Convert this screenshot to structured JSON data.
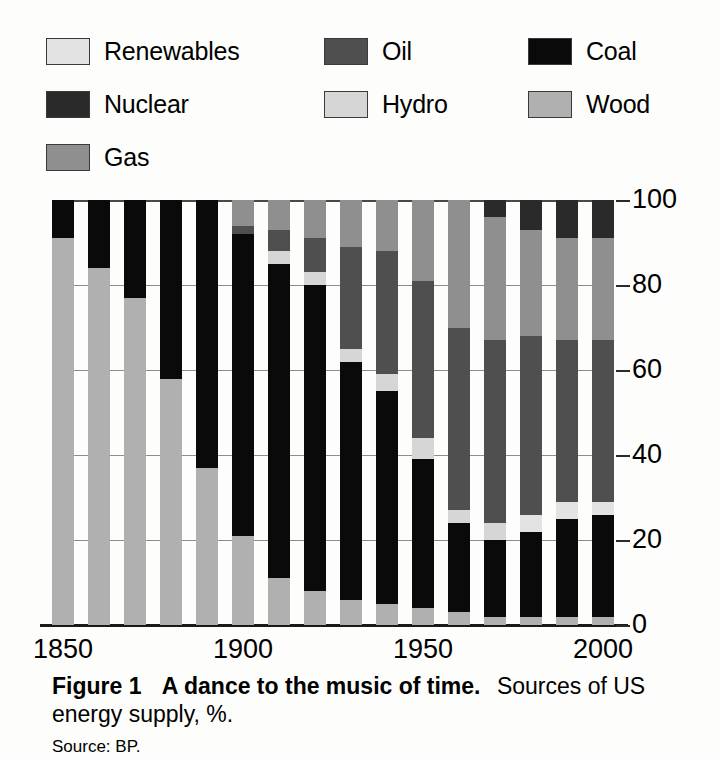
{
  "legend": {
    "items": [
      {
        "label": "Renewables",
        "key": "renewables",
        "color": "#e3e3e3",
        "col": 0,
        "row": 0
      },
      {
        "label": "Nuclear",
        "key": "nuclear",
        "color": "#2a2a2a",
        "col": 0,
        "row": 1
      },
      {
        "label": "Gas",
        "key": "gas",
        "color": "#8f8f8f",
        "col": 0,
        "row": 2
      },
      {
        "label": "Oil",
        "key": "oil",
        "color": "#4f4f4f",
        "col": 1,
        "row": 0
      },
      {
        "label": "Hydro",
        "key": "hydro",
        "color": "#d6d6d6",
        "col": 1,
        "row": 1
      },
      {
        "label": "Coal",
        "key": "coal",
        "color": "#0a0a0a",
        "col": 2,
        "row": 0
      },
      {
        "label": "Wood",
        "key": "wood",
        "color": "#b0b0b0",
        "col": 2,
        "row": 1
      }
    ]
  },
  "caption": {
    "figure_label": "Figure 1",
    "figure_title": "A dance to the music of time.",
    "description_part1": "Sources of US",
    "description_part2": "energy supply, %.",
    "source": "Source: BP."
  },
  "chart_data": {
    "type": "bar",
    "subtype": "stacked-100-percent",
    "title": "A dance to the music of time. Sources of US energy supply, %.",
    "xlabel": "",
    "ylabel": "",
    "ylim": [
      0,
      100
    ],
    "yticks": [
      0,
      20,
      40,
      60,
      80,
      100
    ],
    "ytick_labels": [
      "0",
      "20",
      "40",
      "60",
      "80",
      "100"
    ],
    "grid": true,
    "legend_position": "above-plot",
    "categories": [
      1850,
      1860,
      1870,
      1880,
      1890,
      1900,
      1910,
      1920,
      1930,
      1940,
      1950,
      1960,
      1970,
      1980,
      1990,
      2000
    ],
    "xtick_labels": [
      "1850",
      "1900",
      "1950",
      "2000"
    ],
    "xticks": [
      1850,
      1900,
      1950,
      2000
    ],
    "stack_order_bottom_to_top": [
      "hydro",
      "coal",
      "renewables",
      "oil",
      "gas",
      "nuclear",
      "wood"
    ],
    "series": [
      {
        "name": "Wood",
        "key": "wood",
        "color": "#b0b0b0",
        "values": [
          91,
          84,
          77,
          58,
          37,
          21,
          11,
          8,
          6,
          5,
          4,
          3,
          2,
          2,
          2,
          2
        ]
      },
      {
        "name": "Coal",
        "key": "coal",
        "color": "#0a0a0a",
        "values": [
          9,
          16,
          23,
          42,
          63,
          71,
          77,
          78,
          58,
          51,
          36,
          22,
          18,
          20,
          23,
          23
        ]
      },
      {
        "name": "Oil",
        "key": "oil",
        "color": "#4f4f4f",
        "values": [
          0,
          0,
          0,
          0,
          0,
          2,
          6,
          8,
          25,
          29,
          38,
          44,
          44,
          44,
          40,
          38
        ]
      },
      {
        "name": "Gas",
        "key": "gas",
        "color": "#8f8f8f",
        "values": [
          0,
          0,
          0,
          0,
          0,
          3,
          3,
          3,
          8,
          11,
          18,
          28,
          32,
          26,
          24,
          24
        ]
      },
      {
        "name": "Hydro",
        "key": "hydro",
        "color": "#d6d6d6",
        "values": [
          0,
          0,
          0,
          0,
          0,
          3,
          3,
          3,
          3,
          4,
          4,
          3,
          3,
          3,
          3,
          3
        ]
      },
      {
        "name": "Nuclear",
        "key": "nuclear",
        "color": "#2a2a2a",
        "values": [
          0,
          0,
          0,
          0,
          0,
          0,
          0,
          0,
          0,
          0,
          0,
          0,
          1,
          4,
          8,
          9
        ]
      },
      {
        "name": "Renewables",
        "key": "renewables",
        "color": "#e3e3e3",
        "values": [
          0,
          0,
          0,
          0,
          0,
          0,
          0,
          0,
          0,
          0,
          0,
          0,
          0,
          1,
          0,
          1
        ]
      }
    ],
    "bars": [
      {
        "year": 1850,
        "stack": [
          {
            "key": "wood",
            "from": 0,
            "to": 91
          },
          {
            "key": "coal",
            "from": 91,
            "to": 100
          }
        ]
      },
      {
        "year": 1860,
        "stack": [
          {
            "key": "wood",
            "from": 0,
            "to": 84
          },
          {
            "key": "coal",
            "from": 84,
            "to": 100
          }
        ]
      },
      {
        "year": 1870,
        "stack": [
          {
            "key": "wood",
            "from": 0,
            "to": 77
          },
          {
            "key": "coal",
            "from": 77,
            "to": 100
          }
        ]
      },
      {
        "year": 1880,
        "stack": [
          {
            "key": "wood",
            "from": 0,
            "to": 58
          },
          {
            "key": "coal",
            "from": 58,
            "to": 100
          }
        ]
      },
      {
        "year": 1890,
        "stack": [
          {
            "key": "wood",
            "from": 0,
            "to": 37
          },
          {
            "key": "coal",
            "from": 37,
            "to": 100
          }
        ]
      },
      {
        "year": 1900,
        "stack": [
          {
            "key": "wood",
            "from": 0,
            "to": 21
          },
          {
            "key": "coal",
            "from": 21,
            "to": 92
          },
          {
            "key": "oil",
            "from": 92,
            "to": 94
          },
          {
            "key": "gas",
            "from": 94,
            "to": 100
          }
        ]
      },
      {
        "year": 1910,
        "stack": [
          {
            "key": "wood",
            "from": 0,
            "to": 11
          },
          {
            "key": "coal",
            "from": 11,
            "to": 85
          },
          {
            "key": "hydro",
            "from": 85,
            "to": 88
          },
          {
            "key": "oil",
            "from": 88,
            "to": 93
          },
          {
            "key": "gas",
            "from": 93,
            "to": 100
          }
        ]
      },
      {
        "year": 1920,
        "stack": [
          {
            "key": "wood",
            "from": 0,
            "to": 8
          },
          {
            "key": "coal",
            "from": 8,
            "to": 80
          },
          {
            "key": "hydro",
            "from": 80,
            "to": 83
          },
          {
            "key": "oil",
            "from": 83,
            "to": 91
          },
          {
            "key": "gas",
            "from": 91,
            "to": 100
          }
        ]
      },
      {
        "year": 1930,
        "stack": [
          {
            "key": "wood",
            "from": 0,
            "to": 6
          },
          {
            "key": "coal",
            "from": 6,
            "to": 62
          },
          {
            "key": "hydro",
            "from": 62,
            "to": 65
          },
          {
            "key": "oil",
            "from": 65,
            "to": 89
          },
          {
            "key": "gas",
            "from": 89,
            "to": 100
          }
        ]
      },
      {
        "year": 1940,
        "stack": [
          {
            "key": "wood",
            "from": 0,
            "to": 5
          },
          {
            "key": "coal",
            "from": 5,
            "to": 55
          },
          {
            "key": "hydro",
            "from": 55,
            "to": 59
          },
          {
            "key": "oil",
            "from": 59,
            "to": 88
          },
          {
            "key": "gas",
            "from": 88,
            "to": 100
          }
        ]
      },
      {
        "year": 1950,
        "stack": [
          {
            "key": "wood",
            "from": 0,
            "to": 4
          },
          {
            "key": "coal",
            "from": 4,
            "to": 39
          },
          {
            "key": "hydro",
            "from": 39,
            "to": 44
          },
          {
            "key": "oil",
            "from": 44,
            "to": 81
          },
          {
            "key": "gas",
            "from": 81,
            "to": 100
          }
        ]
      },
      {
        "year": 1960,
        "stack": [
          {
            "key": "wood",
            "from": 0,
            "to": 3
          },
          {
            "key": "coal",
            "from": 3,
            "to": 24
          },
          {
            "key": "hydro",
            "from": 24,
            "to": 27
          },
          {
            "key": "oil",
            "from": 27,
            "to": 70
          },
          {
            "key": "gas",
            "from": 70,
            "to": 100
          }
        ]
      },
      {
        "year": 1970,
        "stack": [
          {
            "key": "wood",
            "from": 0,
            "to": 2
          },
          {
            "key": "coal",
            "from": 2,
            "to": 20
          },
          {
            "key": "hydro",
            "from": 20,
            "to": 24
          },
          {
            "key": "oil",
            "from": 24,
            "to": 67
          },
          {
            "key": "gas",
            "from": 67,
            "to": 96
          },
          {
            "key": "nuclear",
            "from": 96,
            "to": 100
          }
        ]
      },
      {
        "year": 1980,
        "stack": [
          {
            "key": "wood",
            "from": 0,
            "to": 2
          },
          {
            "key": "coal",
            "from": 2,
            "to": 22
          },
          {
            "key": "renewables",
            "from": 22,
            "to": 26
          },
          {
            "key": "oil",
            "from": 26,
            "to": 68
          },
          {
            "key": "gas",
            "from": 68,
            "to": 93
          },
          {
            "key": "nuclear",
            "from": 93,
            "to": 100
          }
        ]
      },
      {
        "year": 1990,
        "stack": [
          {
            "key": "wood",
            "from": 0,
            "to": 2
          },
          {
            "key": "coal",
            "from": 2,
            "to": 25
          },
          {
            "key": "renewables",
            "from": 25,
            "to": 29
          },
          {
            "key": "oil",
            "from": 29,
            "to": 67
          },
          {
            "key": "gas",
            "from": 67,
            "to": 91
          },
          {
            "key": "nuclear",
            "from": 91,
            "to": 100
          }
        ]
      },
      {
        "year": 2000,
        "stack": [
          {
            "key": "wood",
            "from": 0,
            "to": 2
          },
          {
            "key": "coal",
            "from": 2,
            "to": 26
          },
          {
            "key": "renewables",
            "from": 26,
            "to": 29
          },
          {
            "key": "oil",
            "from": 29,
            "to": 67
          },
          {
            "key": "gas",
            "from": 67,
            "to": 91
          },
          {
            "key": "nuclear",
            "from": 91,
            "to": 100
          }
        ]
      }
    ]
  }
}
